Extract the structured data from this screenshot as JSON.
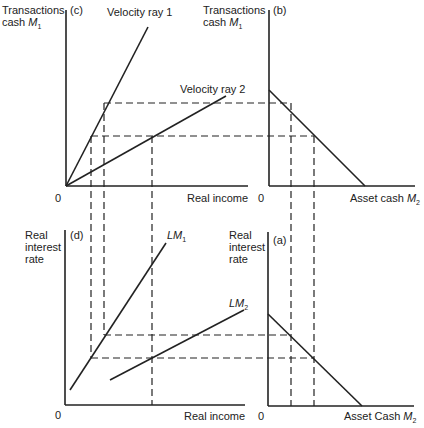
{
  "panels": {
    "c": {
      "tag": "(c)",
      "ylabel_1": "Transactions",
      "ylabel_2": "cash",
      "ylabel_sym": "M",
      "ylabel_sub": "1",
      "xlabel": "Real income",
      "origin": "0",
      "ray1": "Velocity ray 1",
      "ray2": "Velocity ray 2"
    },
    "b": {
      "tag": "(b)",
      "ylabel_1": "Transactions",
      "ylabel_2": "cash",
      "ylabel_sym": "M",
      "ylabel_sub": "1",
      "xlabel": "Asset cash",
      "xlabel_sym": "M",
      "xlabel_sub": "2",
      "origin": "0"
    },
    "d": {
      "tag": "(d)",
      "ylabel_1": "Real",
      "ylabel_2": "interest",
      "ylabel_3": "rate",
      "xlabel": "Real income",
      "origin": "0",
      "lm1": "LM",
      "lm1_sub": "1",
      "lm2": "LM",
      "lm2_sub": "2"
    },
    "a": {
      "tag": "(a)",
      "ylabel_1": "Real",
      "ylabel_2": "interest",
      "ylabel_3": "rate",
      "xlabel": "Asset Cash",
      "xlabel_sym": "M",
      "xlabel_sub": "2",
      "origin": "0"
    }
  },
  "colors": {
    "line": "#222222",
    "background": "#ffffff"
  }
}
